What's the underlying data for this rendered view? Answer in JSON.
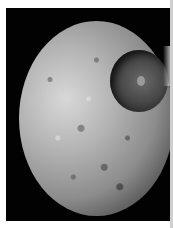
{
  "image": {
    "subject": "Mimas moon photograph",
    "features": [
      "cratered surface",
      "large crater upper right"
    ],
    "colors": {
      "background": "#020202",
      "surface_light": "#d8d8d8",
      "surface_dark": "#4a4a4a",
      "border": "#ffffff"
    }
  }
}
